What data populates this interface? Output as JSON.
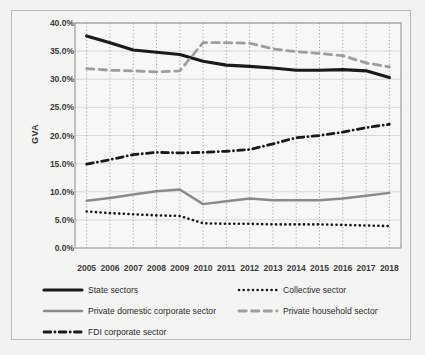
{
  "chart_data": {
    "type": "line",
    "title": "",
    "subtitle": "",
    "xlabel": "",
    "ylabel": "GVA",
    "x": [
      2005,
      2006,
      2007,
      2008,
      2009,
      2010,
      2011,
      2012,
      2013,
      2014,
      2015,
      2016,
      2017,
      2018
    ],
    "categories": [
      "2005",
      "2006",
      "2007",
      "2008",
      "2009",
      "2010",
      "2011",
      "2012",
      "2013",
      "2014",
      "2015",
      "2016",
      "2017",
      "2018"
    ],
    "ylim": [
      0,
      40
    ],
    "ytick_values": [
      0,
      5,
      10,
      15,
      20,
      25,
      30,
      35,
      40
    ],
    "ytick_labels": [
      "0.0%",
      "5.0%",
      "10.0%",
      "15.0%",
      "20.0%",
      "25.0%",
      "30.0%",
      "35.0%",
      "40.0%"
    ],
    "y_unit": "%",
    "grid": {
      "vertical": true,
      "horizontal": true,
      "vertical_style": "dotted",
      "horizontal_style": "solid"
    },
    "legend_position": "bottom",
    "series": [
      {
        "name": "State sectors",
        "style": "solid",
        "color": "#1a1a1a",
        "width": 3.2,
        "values": [
          37.7,
          36.5,
          35.2,
          34.8,
          34.4,
          33.2,
          32.5,
          32.3,
          32.0,
          31.6,
          31.6,
          31.7,
          31.5,
          30.3
        ]
      },
      {
        "name": "Collective sector",
        "style": "dotted",
        "color": "#1a1a1a",
        "width": 2.6,
        "values": [
          6.5,
          6.2,
          6.0,
          5.8,
          5.7,
          4.4,
          4.3,
          4.3,
          4.2,
          4.2,
          4.2,
          4.1,
          4.0,
          3.9
        ]
      },
      {
        "name": "Private domestic corporate sector",
        "style": "solid",
        "color": "#8a8a8a",
        "width": 2.4,
        "values": [
          8.4,
          8.9,
          9.5,
          10.1,
          10.4,
          7.8,
          8.3,
          8.8,
          8.5,
          8.5,
          8.5,
          8.8,
          9.3,
          9.8
        ]
      },
      {
        "name": "Private household sector",
        "style": "dashed",
        "color": "#9d9d9d",
        "width": 2.8,
        "values": [
          31.9,
          31.6,
          31.5,
          31.3,
          31.5,
          36.5,
          36.5,
          36.4,
          35.4,
          34.9,
          34.6,
          34.2,
          32.9,
          32.2
        ]
      },
      {
        "name": "FDI corporate sector",
        "style": "dashdot",
        "color": "#1a1a1a",
        "width": 2.8,
        "values": [
          14.9,
          15.7,
          16.6,
          17.0,
          16.9,
          17.0,
          17.2,
          17.5,
          18.5,
          19.6,
          20.0,
          20.6,
          21.4,
          22.0
        ]
      }
    ]
  },
  "legend": {
    "items": [
      {
        "label": "State sectors"
      },
      {
        "label": "Collective sector"
      },
      {
        "label": "Private domestic corporate sector"
      },
      {
        "label": "Private household sector"
      },
      {
        "label": "FDI corporate sector"
      }
    ]
  }
}
